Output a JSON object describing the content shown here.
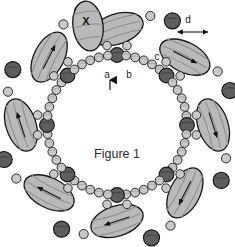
{
  "figure": {
    "caption": "Figure 1",
    "caption_x": 117,
    "caption_y": 158,
    "background": "#ffffff",
    "width": 235,
    "height": 247
  },
  "colors": {
    "ellipse_fill": "#b9b9b9",
    "ellipse_stroke": "#161616",
    "ellipse_stripe": "#8c8c8c",
    "dark_bead_fill": "#5e5e5e",
    "dark_bead_stroke": "#161616",
    "light_bead_fill": "#c9c9c9",
    "light_bead_stroke": "#2a2a2a",
    "label_color": "#1a1a1a",
    "caption_color": "#2b2b2b",
    "arrow_color": "#111111"
  },
  "labels": [
    {
      "id": "label-a",
      "text": "a",
      "x": 107,
      "y": 78,
      "kind": "pointer"
    },
    {
      "id": "label-b",
      "text": "b",
      "x": 129,
      "y": 78,
      "kind": "plain"
    },
    {
      "id": "label-c",
      "text": "c",
      "x": 157,
      "y": 60,
      "kind": "plain"
    },
    {
      "id": "label-d",
      "text": "d",
      "x": 188,
      "y": 23,
      "kind": "range"
    },
    {
      "id": "label-x",
      "text": "X",
      "x": 86,
      "y": 25,
      "kind": "mark"
    }
  ],
  "ring": {
    "center_x": 117,
    "center_y": 125,
    "radius": 70,
    "lobe_count": 8,
    "description": "closed circular bead-and-lobe assembly"
  },
  "lobes": [
    {
      "angle": -90,
      "label": "lobe-top",
      "has_arrow": false,
      "has_satellite": true,
      "satellite_label": "X"
    },
    {
      "angle": -45,
      "label": "lobe-top-right",
      "has_arrow": true,
      "has_satellite": true,
      "satellite_label": "d"
    },
    {
      "angle": 0,
      "label": "lobe-right",
      "has_arrow": true,
      "has_satellite": true,
      "satellite_label": ""
    },
    {
      "angle": 45,
      "label": "lobe-bottom-right",
      "has_arrow": true,
      "has_satellite": true,
      "satellite_label": ""
    },
    {
      "angle": 90,
      "label": "lobe-bottom",
      "has_arrow": true,
      "has_satellite": true,
      "satellite_label": ""
    },
    {
      "angle": 135,
      "label": "lobe-bottom-left",
      "has_arrow": true,
      "has_satellite": true,
      "satellite_label": ""
    },
    {
      "angle": 180,
      "label": "lobe-left",
      "has_arrow": true,
      "has_satellite": true,
      "satellite_label": ""
    },
    {
      "angle": 225,
      "label": "lobe-top-left",
      "has_arrow": true,
      "has_satellite": true,
      "satellite_label": ""
    }
  ],
  "annotations": {
    "a_arrow": "upward arrow pointing to bead a on ring",
    "d_arrow": "double-headed horizontal arrow indicating spacing d"
  }
}
